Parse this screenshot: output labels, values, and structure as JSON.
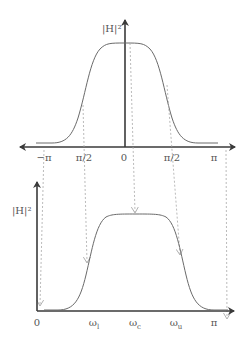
{
  "colors": {
    "axis": "#3a3a3a",
    "curve": "#6a6a6a",
    "guide": "#a8a8a8",
    "text": "#555555"
  },
  "top_plot": {
    "y_label": "|H|²",
    "x_ticks": [
      "−π",
      "π/2",
      "0",
      "π/2",
      "π"
    ]
  },
  "bottom_plot": {
    "y_label": "|H|²",
    "x_ticks": [
      "0",
      "ω_l",
      "ω_c",
      "ω_u",
      "π"
    ],
    "x_tick_main": [
      "0",
      "ω",
      "ω",
      "ω",
      "π"
    ],
    "x_tick_sub": [
      "",
      "l",
      "c",
      "u",
      ""
    ]
  }
}
